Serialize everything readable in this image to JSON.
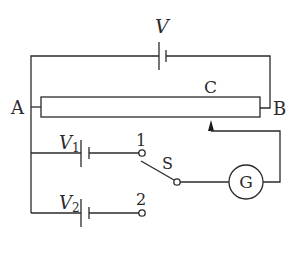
{
  "diagram": {
    "type": "potentiometer circuit",
    "labels": {
      "main_source": "V",
      "end_a": "A",
      "end_b": "B",
      "wire_point": "C",
      "cell_1": "V",
      "cell_1_sub": "1",
      "cell_2": "V",
      "cell_2_sub": "2",
      "terminal_1": "1",
      "terminal_2": "2",
      "switch": "S",
      "galvanometer": "G"
    },
    "components": [
      {
        "id": "battery-V",
        "kind": "cell",
        "label": "V"
      },
      {
        "id": "resistance-wire-AB",
        "kind": "slide wire",
        "ends": [
          "A",
          "B"
        ],
        "point": "C"
      },
      {
        "id": "jockey",
        "kind": "sliding contact",
        "position": "C"
      },
      {
        "id": "cell-V1",
        "kind": "cell",
        "label": "V1",
        "connects_to": "1"
      },
      {
        "id": "cell-V2",
        "kind": "cell",
        "label": "V2",
        "connects_to": "2"
      },
      {
        "id": "switch-S",
        "kind": "two-way switch",
        "positions": [
          "1",
          "2"
        ],
        "current": "1"
      },
      {
        "id": "galvanometer-G",
        "kind": "galvanometer",
        "label": "G"
      }
    ]
  }
}
